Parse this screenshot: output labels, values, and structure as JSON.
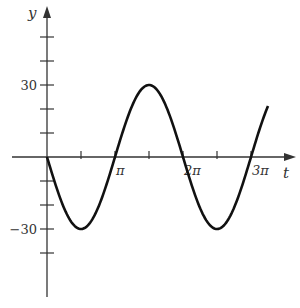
{
  "chart_data": {
    "type": "line",
    "title": "",
    "xlabel": "t",
    "ylabel": "y",
    "function": "y = -30 sin(t)",
    "xlim_pi": [
      0,
      3.25
    ],
    "ylim": [
      -50,
      60
    ],
    "x_ticks": [
      {
        "value_pi": 0.5,
        "label": ""
      },
      {
        "value_pi": 1,
        "label": "π"
      },
      {
        "value_pi": 1.5,
        "label": ""
      },
      {
        "value_pi": 2,
        "label": "2π"
      },
      {
        "value_pi": 2.5,
        "label": ""
      },
      {
        "value_pi": 3,
        "label": "3π"
      }
    ],
    "y_ticks": [
      {
        "value": 50,
        "label": ""
      },
      {
        "value": 40,
        "label": ""
      },
      {
        "value": 30,
        "label": "30"
      },
      {
        "value": 20,
        "label": ""
      },
      {
        "value": 10,
        "label": ""
      },
      {
        "value": -10,
        "label": ""
      },
      {
        "value": -20,
        "label": ""
      },
      {
        "value": -30,
        "label": "−30"
      },
      {
        "value": -40,
        "label": ""
      }
    ],
    "series": [
      {
        "name": "y(t)",
        "amplitude": 30,
        "t_start_pi": 0,
        "t_end_pi": 3.25,
        "key_points": [
          {
            "t_pi": 0,
            "y": 0
          },
          {
            "t_pi": 0.5,
            "y": -30
          },
          {
            "t_pi": 1,
            "y": 0
          },
          {
            "t_pi": 1.5,
            "y": 30
          },
          {
            "t_pi": 2,
            "y": 0
          },
          {
            "t_pi": 2.5,
            "y": -30
          },
          {
            "t_pi": 3,
            "y": 0
          },
          {
            "t_pi": 3.25,
            "y": 21.2
          }
        ]
      }
    ],
    "grid": false,
    "legend": "none"
  }
}
